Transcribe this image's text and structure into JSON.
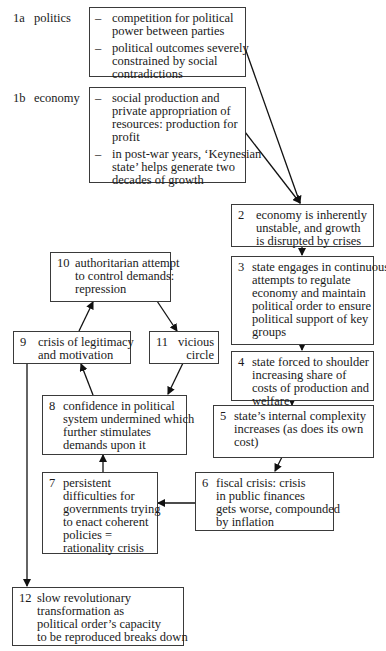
{
  "diagram": {
    "inputs": [
      {
        "id": "1a",
        "label": "politics",
        "bullets": [
          "competition for political\npower between parties",
          "political outcomes severely\nconstrained by social\ncontradictions"
        ]
      },
      {
        "id": "1b",
        "label": "economy",
        "bullets": [
          "social production and\nprivate appropriation of\nresources: production for\nprofit",
          "in post-war years, ‘Keynesian\nstate’ helps generate two\ndecades of growth"
        ]
      }
    ],
    "nodes": [
      {
        "id": "2",
        "text": "economy is inherently\nunstable, and growth\nis disrupted by crises"
      },
      {
        "id": "3",
        "text": "state engages in continuous\nattempts to regulate\neconomy and maintain\npolitical order to ensure\npolitical support of key\ngroups"
      },
      {
        "id": "4",
        "text": "state forced to shoulder\nincreasing share of\ncosts of production and\nwelfare"
      },
      {
        "id": "5",
        "text": "state’s internal complexity\nincreases (as does its own\ncost)"
      },
      {
        "id": "6",
        "text": "fiscal crisis: crisis\nin public finances\ngets worse, compounded\nby inflation"
      },
      {
        "id": "7",
        "text": "persistent\ndifficulties for\ngovernments trying\nto enact coherent\npolicies =\nrationality crisis"
      },
      {
        "id": "8",
        "text": "confidence in political\nsystem undermined which\nfurther stimulates\ndemands upon it"
      },
      {
        "id": "9",
        "text": "crisis of legitimacy\nand motivation"
      },
      {
        "id": "10",
        "text": "authoritarian attempt\nto control demands:\nrepression"
      },
      {
        "id": "11",
        "text": "vicious\ncircle"
      },
      {
        "id": "12",
        "text": "slow revolutionary\ntransformation as\npolitical order’s capacity\nto be reproduced breaks down"
      }
    ],
    "edges": [
      [
        "1a",
        "2"
      ],
      [
        "1b",
        "2"
      ],
      [
        "2",
        "3"
      ],
      [
        "3",
        "4"
      ],
      [
        "4",
        "5"
      ],
      [
        "5",
        "6"
      ],
      [
        "6",
        "7"
      ],
      [
        "7",
        "8"
      ],
      [
        "8",
        "9"
      ],
      [
        "9",
        "10"
      ],
      [
        "10",
        "11"
      ],
      [
        "11",
        "8"
      ],
      [
        "9",
        "12"
      ]
    ]
  }
}
